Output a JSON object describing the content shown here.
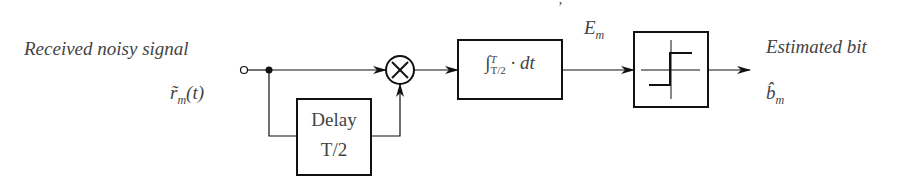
{
  "diagram": {
    "input_label": "Received noisy signal",
    "input_symbol": "r̃",
    "input_symbol_sub": "m",
    "input_symbol_arg": "(t)",
    "delay_block": {
      "line1": "Delay",
      "line2": "T/2"
    },
    "multiplier_symbol": "⊗",
    "integrator_block": {
      "integral": "∫",
      "upper": "T",
      "lower": "T/2",
      "body": "· dt"
    },
    "energy_label": "E",
    "energy_sub": "m",
    "decision_block": "sign-threshold",
    "output_label": "Estimated bit",
    "output_symbol": "b̂",
    "output_symbol_sub": "m",
    "stray_mark": "’"
  }
}
